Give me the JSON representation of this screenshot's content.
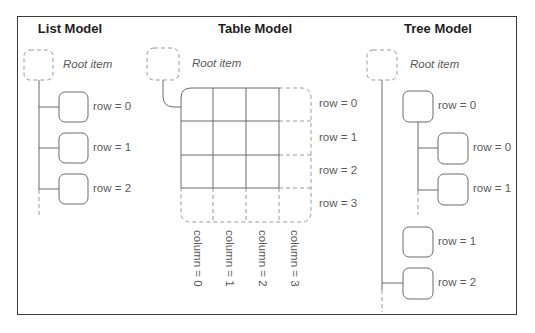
{
  "colors": {
    "frame": "#3a3a3a",
    "solid_line": "#6b6b6b",
    "dashed_line": "#9a9a9a",
    "title_text": "#1e1e1e",
    "label_text": "#5a5a5a"
  },
  "list_model": {
    "title": "List Model",
    "root_label": "Root item",
    "rows": [
      {
        "label": "row = 0"
      },
      {
        "label": "row = 1"
      },
      {
        "label": "row = 2"
      }
    ]
  },
  "table_model": {
    "title": "Table Model",
    "root_label": "Root item",
    "rows": [
      {
        "label": "row = 0"
      },
      {
        "label": "row = 1"
      },
      {
        "label": "row = 2"
      },
      {
        "label": "row = 3"
      }
    ],
    "columns": [
      {
        "label": "column = 0"
      },
      {
        "label": "column = 1"
      },
      {
        "label": "column = 2"
      },
      {
        "label": "column = 3"
      }
    ]
  },
  "tree_model": {
    "title": "Tree Model",
    "root_label": "Root item",
    "top_level_rows": [
      {
        "label": "row = 0",
        "children": [
          {
            "label": "row = 0"
          },
          {
            "label": "row = 1"
          }
        ]
      },
      {
        "label": "row = 1"
      },
      {
        "label": "row = 2"
      }
    ]
  }
}
